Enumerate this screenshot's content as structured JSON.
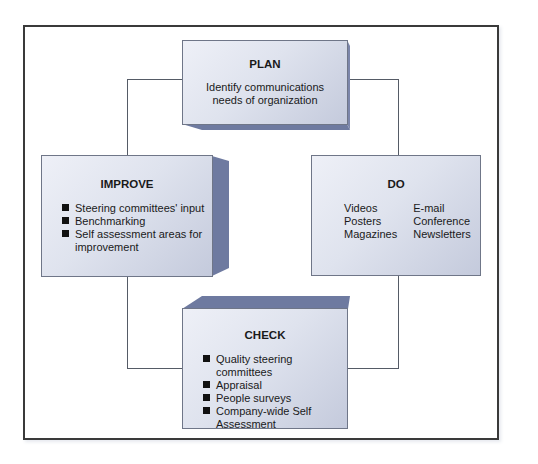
{
  "diagram": {
    "type": "PDCA cycle",
    "boxes": {
      "plan": {
        "title": "PLAN",
        "description_lines": [
          "Identify communications",
          "needs of organization"
        ]
      },
      "do": {
        "title": "DO",
        "columns": [
          [
            "Videos",
            "Posters",
            "Magazines"
          ],
          [
            "E-mail",
            "Conference",
            "Newsletters"
          ]
        ]
      },
      "check": {
        "title": "CHECK",
        "bullets": [
          "Quality steering committees",
          "Appraisal",
          "People surveys",
          "Company-wide Self Assessment"
        ]
      },
      "improve": {
        "title": "IMPROVE",
        "bullets": [
          "Steering committees' input",
          "Benchmarking",
          "Self assessment areas for improvement"
        ]
      }
    },
    "colors": {
      "box_face_light": "#eef0f7",
      "box_face_dark": "#c4cadc",
      "bevel": "#6e7aa0",
      "border": "#3a3a3a",
      "connector": "#555b66"
    }
  }
}
